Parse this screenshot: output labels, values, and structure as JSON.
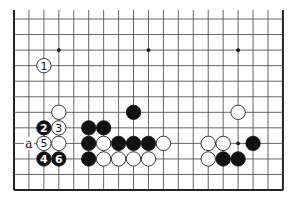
{
  "board": {
    "columns": 19,
    "rows": 12,
    "origin_x": 14,
    "origin_y": 19,
    "spacing_x": 14.94,
    "spacing_y": 15.55,
    "top_overhang": 9,
    "open_top": true,
    "stone_radius": 7.2,
    "colors": {
      "background": "#ffffff",
      "grid": "#555555",
      "edge": "#222222",
      "black_stone": "#111111",
      "white_stone": "#ffffff"
    },
    "star_points": [
      {
        "col": 3,
        "row": 2
      },
      {
        "col": 9,
        "row": 2
      },
      {
        "col": 15,
        "row": 2
      },
      {
        "col": 15,
        "row": 8
      }
    ],
    "stones": [
      {
        "col": 2,
        "row": 3,
        "color": "white",
        "label": "1"
      },
      {
        "col": 3,
        "row": 6,
        "color": "white",
        "label": ""
      },
      {
        "col": 8,
        "row": 6,
        "color": "black",
        "label": ""
      },
      {
        "col": 15,
        "row": 6,
        "color": "white",
        "label": ""
      },
      {
        "col": 2,
        "row": 7,
        "color": "black",
        "label": "2"
      },
      {
        "col": 3,
        "row": 7,
        "color": "white",
        "label": "3"
      },
      {
        "col": 5,
        "row": 7,
        "color": "black",
        "label": ""
      },
      {
        "col": 6,
        "row": 7,
        "color": "black",
        "label": ""
      },
      {
        "col": 2,
        "row": 8,
        "color": "white",
        "label": "5"
      },
      {
        "col": 3,
        "row": 8,
        "color": "white",
        "label": ""
      },
      {
        "col": 5,
        "row": 8,
        "color": "black",
        "label": ""
      },
      {
        "col": 6,
        "row": 8,
        "color": "white",
        "label": ""
      },
      {
        "col": 7,
        "row": 8,
        "color": "black",
        "label": ""
      },
      {
        "col": 8,
        "row": 8,
        "color": "black",
        "label": ""
      },
      {
        "col": 9,
        "row": 8,
        "color": "black",
        "label": ""
      },
      {
        "col": 10,
        "row": 8,
        "color": "white",
        "label": ""
      },
      {
        "col": 13,
        "row": 8,
        "color": "white",
        "label": ""
      },
      {
        "col": 14,
        "row": 8,
        "color": "white",
        "label": ""
      },
      {
        "col": 16,
        "row": 8,
        "color": "black",
        "label": ""
      },
      {
        "col": 2,
        "row": 9,
        "color": "black",
        "label": "4"
      },
      {
        "col": 3,
        "row": 9,
        "color": "black",
        "label": "6"
      },
      {
        "col": 5,
        "row": 9,
        "color": "black",
        "label": ""
      },
      {
        "col": 6,
        "row": 9,
        "color": "white",
        "label": ""
      },
      {
        "col": 7,
        "row": 9,
        "color": "white",
        "label": ""
      },
      {
        "col": 8,
        "row": 9,
        "color": "white",
        "label": ""
      },
      {
        "col": 9,
        "row": 9,
        "color": "white",
        "label": ""
      },
      {
        "col": 13,
        "row": 9,
        "color": "white",
        "label": ""
      },
      {
        "col": 14,
        "row": 9,
        "color": "black",
        "label": ""
      },
      {
        "col": 15,
        "row": 9,
        "color": "black",
        "label": ""
      }
    ],
    "point_labels": [
      {
        "col": 1,
        "row": 8,
        "text": "a"
      }
    ]
  }
}
